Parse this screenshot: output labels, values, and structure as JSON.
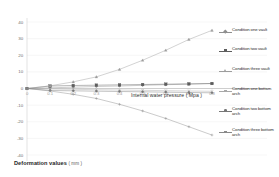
{
  "chart_data": {
    "type": "line",
    "title": "",
    "xlabel": "Internal water pressure",
    "xlabel_unit": "( Mpa )",
    "ylabel": "Deformation values",
    "ylabel_unit": "( mm )",
    "xlim": [
      0,
      0.8
    ],
    "ylim": [
      -40,
      40
    ],
    "xticks": [
      "0",
      "0.1",
      "0.2",
      "0.3",
      "0.4",
      "0.5",
      "0.6",
      "0.7",
      "0.8"
    ],
    "yticks": [
      "40",
      "30",
      "20",
      "10",
      "0",
      "-10",
      "-20",
      "-30",
      "-40"
    ],
    "grid": true,
    "grid_axis": "y",
    "legend_position": "right",
    "x": [
      0,
      0.1,
      0.2,
      0.3,
      0.4,
      0.5,
      0.6,
      0.7,
      0.8
    ],
    "series": [
      {
        "name": "Condition one vault",
        "marker": "diamond",
        "color": "#8f8f8f",
        "values": [
          0.0,
          0.4,
          0.8,
          1.2,
          1.5,
          1.9,
          2.3,
          2.6,
          3.0
        ]
      },
      {
        "name": "Condition two vault",
        "marker": "square",
        "color": "#5d5d5d",
        "values": [
          0.0,
          1.5,
          1.8,
          2.0,
          2.2,
          2.4,
          2.6,
          2.8,
          3.0
        ]
      },
      {
        "name": "Condition three vault",
        "marker": "triangle",
        "color": "#9d9d9d",
        "values": [
          0.0,
          1.6,
          4.0,
          7.0,
          11.5,
          17.0,
          23.0,
          29.5,
          35.0
        ]
      },
      {
        "name": "Condition one bottom arch",
        "marker": "cross",
        "color": "#a8a8a8",
        "values": [
          0.0,
          -0.3,
          -0.5,
          -0.7,
          -0.9,
          -1.1,
          -1.3,
          -1.5,
          -1.7
        ]
      },
      {
        "name": "Condition two bottom arch",
        "marker": "dot",
        "color": "#777777",
        "values": [
          0.0,
          -1.2,
          -1.4,
          -1.6,
          -1.8,
          -2.0,
          -2.2,
          -2.4,
          -2.6
        ]
      },
      {
        "name": "Condition three bottom arch",
        "marker": "plus",
        "color": "#8a8a8a",
        "values": [
          0.0,
          -1.5,
          -3.5,
          -6.0,
          -9.5,
          -13.5,
          -18.0,
          -23.0,
          -28.0
        ]
      }
    ]
  },
  "legend": {
    "items": [
      {
        "label": "Condition one vault"
      },
      {
        "label": "Condition two vault"
      },
      {
        "label": "Condition three vault"
      },
      {
        "label": "Condition one bottom arch"
      },
      {
        "label": "Condition two bottom arch"
      },
      {
        "label": "Condition three bottom arch"
      }
    ]
  }
}
